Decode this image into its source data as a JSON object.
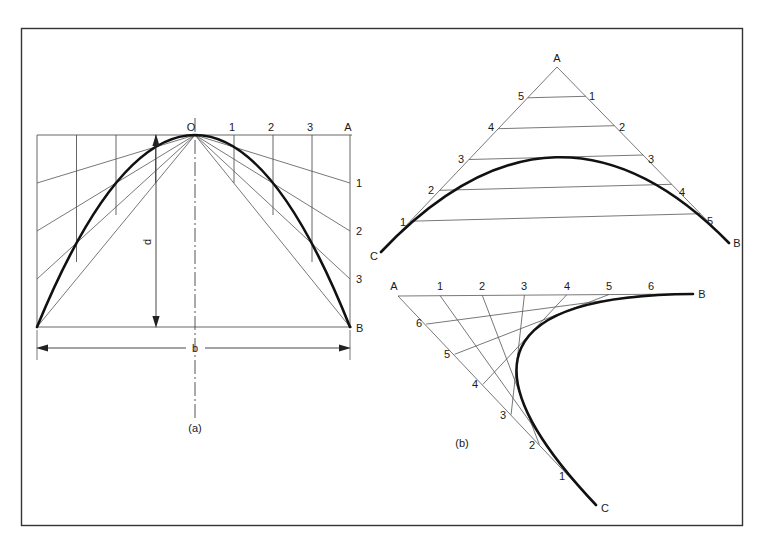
{
  "figure": {
    "background_color": "#ffffff",
    "ink_color": "#1a1a1a",
    "thin_line_color": "#555555",
    "frame": {
      "x": 21,
      "y": 28,
      "width": 721,
      "height": 497,
      "stroke": "#333333"
    }
  },
  "diagram_a": {
    "caption": "(a)",
    "dimension_width_label": "b",
    "dimension_height_label": "d",
    "apex_label": "O",
    "right_top_label": "A",
    "right_bottom_label": "B",
    "top_divisions": [
      "1",
      "2",
      "3"
    ],
    "right_divisions": [
      "1",
      "2",
      "3"
    ],
    "geometry": {
      "apex": [
        195,
        135
      ],
      "left_base": [
        37,
        327
      ],
      "right_base": [
        350,
        327
      ],
      "top_left": [
        37,
        135
      ],
      "top_right": [
        350,
        135
      ],
      "baseline_y": 327,
      "dimension_line_y": 348,
      "centerline_x": 195,
      "axis_top_y": 118,
      "axis_bottom_y": 420,
      "divisions": 4
    }
  },
  "diagram_b_upper": {
    "apex_label": "A",
    "left_end_label": "C",
    "right_end_label": "B",
    "left_divisions": [
      "1",
      "2",
      "3",
      "4",
      "5"
    ],
    "right_divisions": [
      "1",
      "2",
      "3",
      "4",
      "5"
    ],
    "geometry": {
      "apex": [
        557,
        67
      ],
      "left_end": [
        381,
        252
      ],
      "right_end": [
        729,
        243
      ],
      "divisions": 6
    }
  },
  "diagram_b_lower": {
    "caption": "(b)",
    "apex_label": "A",
    "right_end_label": "B",
    "bottom_end_label": "C",
    "top_divisions": [
      "1",
      "2",
      "3",
      "4",
      "5",
      "6"
    ],
    "side_divisions": [
      "1",
      "2",
      "3",
      "4",
      "5",
      "6"
    ],
    "geometry": {
      "apex": [
        398,
        296
      ],
      "right_end": [
        693,
        294
      ],
      "bottom_end": [
        596,
        505
      ],
      "divisions": 7
    }
  }
}
